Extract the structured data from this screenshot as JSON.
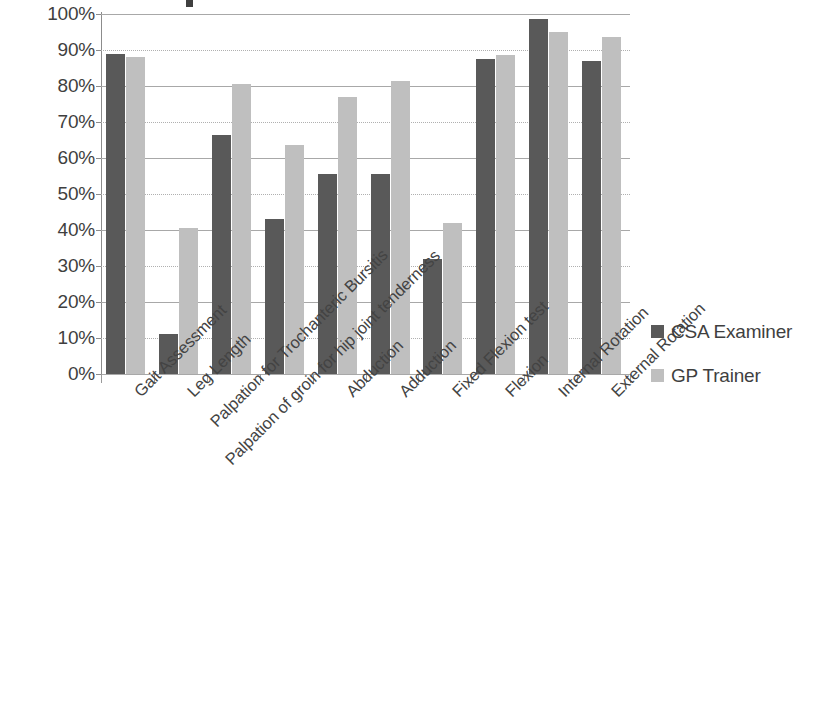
{
  "chart_data": {
    "type": "bar",
    "title": "",
    "xlabel": "",
    "ylabel": "",
    "ylim": [
      0,
      100
    ],
    "ytick_labels": [
      "100%",
      "90%",
      "80%",
      "70%",
      "60%",
      "50%",
      "40%",
      "30%",
      "20%",
      "10%",
      "0%"
    ],
    "ytick_values": [
      100,
      90,
      80,
      70,
      60,
      50,
      40,
      30,
      20,
      10,
      0
    ],
    "grid": true,
    "legend_position": "right",
    "categories": [
      "Gait Assessment",
      "Leg Length",
      "Palpation for Trochanteric Bursitis",
      "Palpation of groin for hip joint tenderness",
      "Abduction",
      "Adduction",
      "Fixed Flexion test",
      "Flexion",
      "Internal Rotation",
      "External Rotation"
    ],
    "series": [
      {
        "name": "CSA Examiner",
        "color": "#595959",
        "values": [
          89,
          11,
          66.5,
          43,
          55.5,
          55.5,
          32,
          87.5,
          98.5,
          87
        ]
      },
      {
        "name": "GP Trainer",
        "color": "#bfbfbf",
        "values": [
          88,
          40.5,
          80.5,
          63.5,
          77,
          81.5,
          42,
          88.5,
          95,
          93.5
        ]
      }
    ]
  },
  "legend": {
    "items": [
      {
        "label": "CSA Examiner",
        "color": "#595959"
      },
      {
        "label": "GP Trainer",
        "color": "#bfbfbf"
      }
    ]
  }
}
